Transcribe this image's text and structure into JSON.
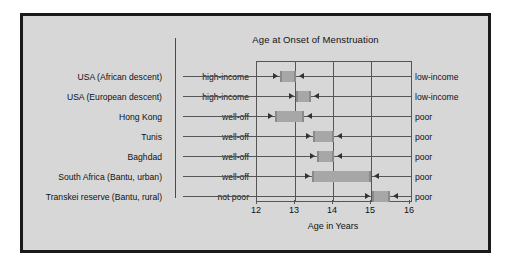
{
  "chart_data": {
    "type": "bar",
    "title": "Age at Onset of Menstruation",
    "xlabel": "Age in Years",
    "ylabel": "",
    "xlim": [
      12,
      16
    ],
    "xticks": [
      12,
      13,
      14,
      15,
      16
    ],
    "xtick_labels": [
      "12",
      "13",
      "14",
      "15",
      "16"
    ],
    "grid": true,
    "legend": "none",
    "orientation": "horizontal",
    "note": "Each bar spans the age range between the affluent group (left label) and the poor group (right label).",
    "categories": [
      "USA (African descent)",
      "USA (European descent)",
      "Hong Kong",
      "Tunis",
      "Baghdad",
      "South Africa (Bantu, urban)",
      "Transkei reserve (Bantu, rural)"
    ],
    "left_groups": [
      "high-income",
      "high-income",
      "well-off",
      "well-off",
      "well-off",
      "well-off",
      "not poor"
    ],
    "right_groups": [
      "low-income",
      "low-income",
      "poor",
      "poor",
      "poor",
      "poor",
      "poor"
    ],
    "bars": [
      {
        "label": "USA (African descent)",
        "start": 12.62,
        "end": 13.05
      },
      {
        "label": "USA (European descent)",
        "start": 13.03,
        "end": 13.43
      },
      {
        "label": "Hong Kong",
        "start": 12.5,
        "end": 13.25
      },
      {
        "label": "Tunis",
        "start": 13.48,
        "end": 14.02
      },
      {
        "label": "Baghdad",
        "start": 13.58,
        "end": 14.02
      },
      {
        "label": "South Africa (Bantu, urban)",
        "start": 13.45,
        "end": 14.98
      },
      {
        "label": "Transkei reserve (Bantu, rural)",
        "start": 15.0,
        "end": 15.48
      }
    ],
    "values": [
      0.43,
      0.4,
      0.75,
      0.54,
      0.44,
      1.53,
      0.48
    ]
  },
  "colors": {
    "frame": "#1a1a1a",
    "background": "#d7d7d7",
    "page": "#ffffff",
    "bar_fill": "#a7a7a7",
    "bar_cap": "#8a8a8a",
    "axis": "#555555",
    "text": "#111111"
  }
}
